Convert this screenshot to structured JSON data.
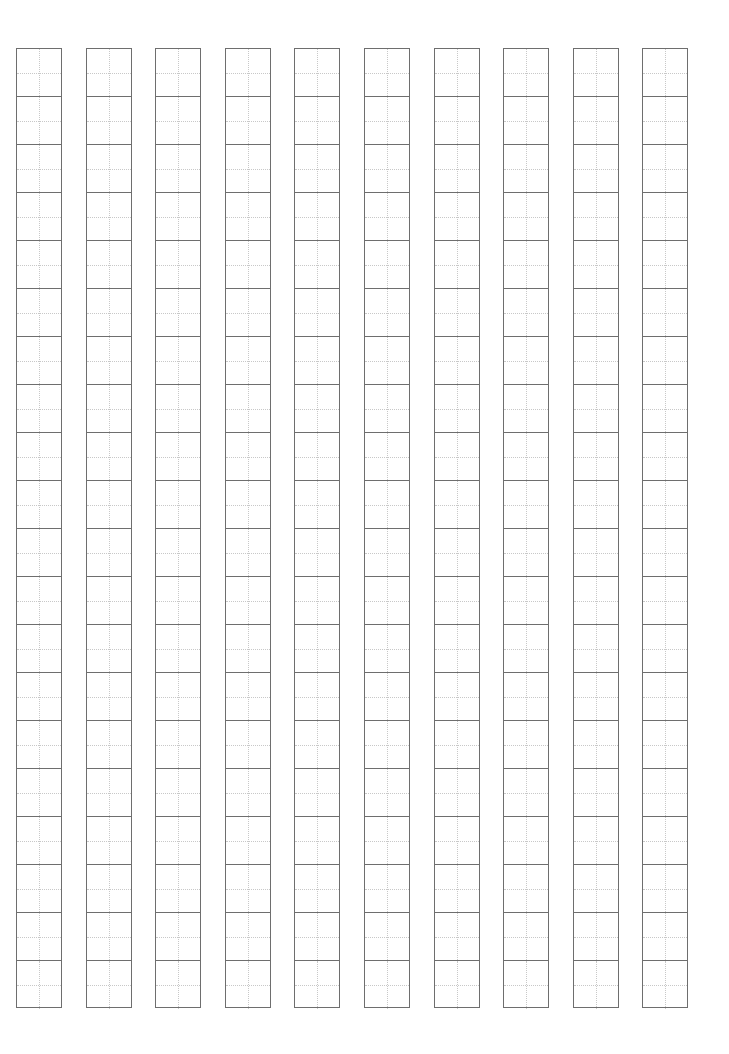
{
  "sheet": {
    "type": "tianzige-practice-sheet",
    "columns": 10,
    "rows_per_column": 20,
    "cell_style": "field-grid with dotted center guides",
    "colors": {
      "border": "#6e6e6e",
      "guide": "#c8c8c8",
      "background": "#ffffff"
    }
  }
}
